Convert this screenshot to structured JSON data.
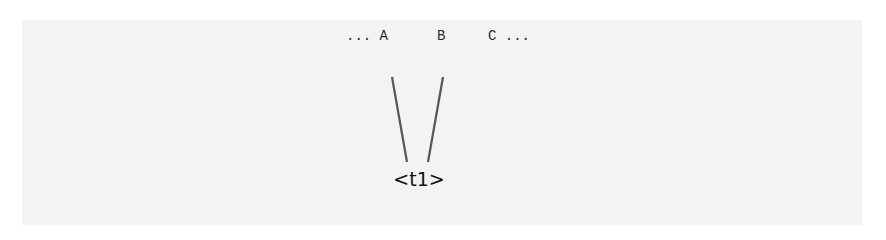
{
  "diagram": {
    "type": "tree-fragment",
    "sequence": {
      "left_ellipsis": "...",
      "tokens": [
        "A",
        "B",
        "C"
      ],
      "right_ellipsis": "..."
    },
    "sequence_text": {
      "a": "... A",
      "b": "B",
      "c": "C ..."
    },
    "node": {
      "label": "<t1>"
    },
    "edges": [
      {
        "from": "A",
        "to": "<t1>"
      },
      {
        "from": "B",
        "to": "<t1>"
      }
    ],
    "colors": {
      "background": "#ffffff",
      "panel": "#f3f3f3",
      "edge": "#555555",
      "text": "#111111"
    }
  }
}
